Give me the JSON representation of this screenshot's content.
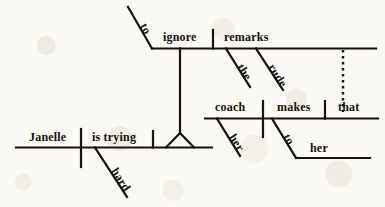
{
  "diagram": {
    "type": "reed-kellogg-sentence-diagram",
    "sentence": "Janelle is trying hard to ignore the rude remarks that her coach makes to her.",
    "colors": {
      "ink": "#16120d",
      "paper": "#fbf9f3"
    },
    "nodes": {
      "subject": "Janelle",
      "predicate": "is trying",
      "adverb": "hard",
      "infinitive_marker": "to",
      "infinitive_verb": "ignore",
      "infinitive_object": "remarks",
      "article": "the",
      "adjective": "rude",
      "relative_pronoun": "that",
      "rel_possessive": "her",
      "rel_subject": "coach",
      "rel_verb": "makes",
      "prep": "to",
      "prep_object": "her"
    },
    "labels": [
      {
        "id": "janelle",
        "text": "Janelle",
        "role": "subject"
      },
      {
        "id": "is-trying",
        "text": "is trying",
        "role": "predicate"
      },
      {
        "id": "hard",
        "text": "hard",
        "role": "adverb-modifier"
      },
      {
        "id": "to-1",
        "text": "to",
        "role": "infinitive-marker"
      },
      {
        "id": "ignore",
        "text": "ignore",
        "role": "infinitive-verb"
      },
      {
        "id": "remarks",
        "text": "remarks",
        "role": "direct-object"
      },
      {
        "id": "the",
        "text": "the",
        "role": "article-modifier"
      },
      {
        "id": "rude",
        "text": "rude",
        "role": "adjective-modifier"
      },
      {
        "id": "coach",
        "text": "coach",
        "role": "relative-clause-subject"
      },
      {
        "id": "makes",
        "text": "makes",
        "role": "relative-clause-verb"
      },
      {
        "id": "that",
        "text": "that",
        "role": "relative-pronoun-object"
      },
      {
        "id": "her-1",
        "text": "her",
        "role": "possessive-modifier"
      },
      {
        "id": "to-2",
        "text": "to",
        "role": "preposition"
      },
      {
        "id": "her-2",
        "text": "her",
        "role": "object-of-preposition"
      }
    ]
  }
}
